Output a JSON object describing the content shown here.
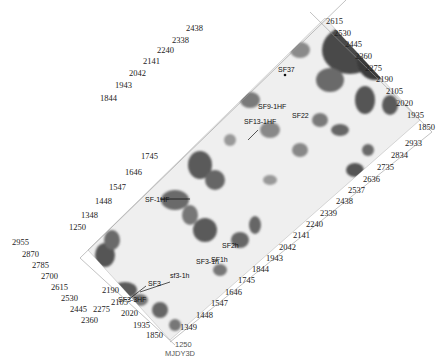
{
  "map": {
    "survey_name": "MJDY3D",
    "survey_inline_label": "1250",
    "colors": {
      "background": "#ffffff",
      "base_fill": "#efefef",
      "anomaly_dark": "#3a3a3a",
      "anomaly_mid": "#7a7a7a",
      "anomaly_light": "#b5b5b5",
      "axis": "#888888",
      "text": "#222222"
    },
    "axes": {
      "top_left_edge": {
        "labels": [
          "1250",
          "1348",
          "1448",
          "1547",
          "1646",
          "1745",
          "1844",
          "1943",
          "2042",
          "2141",
          "2240",
          "2338",
          "2438"
        ]
      },
      "top_right_edge": {
        "labels": [
          "2615",
          "2530",
          "2445",
          "2360",
          "2275",
          "2190",
          "2105",
          "2020",
          "1935",
          "1850"
        ]
      },
      "bottom_right_edge": {
        "labels": [
          "1349",
          "1448",
          "1547",
          "1646",
          "1745",
          "1844",
          "1943",
          "2042",
          "2141",
          "2240",
          "2339",
          "2438",
          "2537",
          "2636",
          "2735",
          "2834",
          "2933"
        ]
      },
      "bottom_left_edge": {
        "labels": [
          "2955",
          "2870",
          "2785",
          "2700",
          "2615",
          "2530",
          "2445",
          "2360",
          "2275",
          "2190",
          "2105",
          "2020",
          "1935",
          "1850"
        ]
      }
    },
    "wells": [
      {
        "name": "SF37",
        "x": 285,
        "y": 72
      },
      {
        "name": "SF9-1HF",
        "x": 265,
        "y": 107
      },
      {
        "name": "SF13-1HF",
        "x": 250,
        "y": 123
      },
      {
        "name": "SF22",
        "x": 296,
        "y": 116
      },
      {
        "name": "SF-1HF",
        "x": 150,
        "y": 200
      },
      {
        "name": "SF2h",
        "x": 222,
        "y": 244
      },
      {
        "name": "SF3-1h",
        "x": 198,
        "y": 260
      },
      {
        "name": "SF1h",
        "x": 212,
        "y": 260
      },
      {
        "name": "sf3-1h",
        "x": 170,
        "y": 276
      },
      {
        "name": "SF3",
        "x": 148,
        "y": 283
      },
      {
        "name": "SF3-3HF",
        "x": 124,
        "y": 298
      }
    ]
  }
}
